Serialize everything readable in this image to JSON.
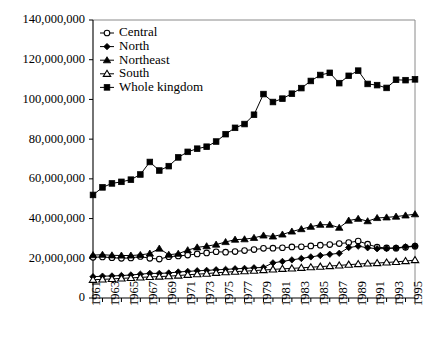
{
  "chart_data": {
    "type": "line",
    "title": "",
    "xlabel": "",
    "ylabel": "",
    "xlim": [
      1961,
      1995
    ],
    "ylim": [
      0,
      140000000
    ],
    "grid": false,
    "legend_position": "top-left inside plot",
    "x": [
      1961,
      1962,
      1963,
      1964,
      1965,
      1966,
      1967,
      1968,
      1969,
      1970,
      1971,
      1972,
      1973,
      1974,
      1975,
      1976,
      1977,
      1978,
      1979,
      1980,
      1981,
      1982,
      1983,
      1984,
      1985,
      1986,
      1987,
      1988,
      1989,
      1990,
      1991,
      1992,
      1993,
      1994,
      1995
    ],
    "xtick_labels": [
      "1961",
      "1963",
      "1965",
      "1967",
      "1969",
      "1971",
      "1973",
      "1975",
      "1977",
      "1979",
      "1981",
      "1983",
      "1985",
      "1987",
      "1989",
      "1991",
      "1993",
      "1995"
    ],
    "ytick_labels": [
      "0",
      "20,000,000",
      "40,000,000",
      "60,000,000",
      "80,000,000",
      "100,000,000",
      "120,000,000",
      "140,000,000"
    ],
    "ytick_values": [
      0,
      20000000,
      40000000,
      60000000,
      80000000,
      100000000,
      120000000,
      140000000
    ],
    "series": [
      {
        "name": "Central",
        "marker": "open-circle",
        "values": [
          20500000,
          20700000,
          20300000,
          20000000,
          20200000,
          20900000,
          20000000,
          19600000,
          20800000,
          21200000,
          21600000,
          22200000,
          22700000,
          23300000,
          23100000,
          23400000,
          23900000,
          24400000,
          25000000,
          25100000,
          25300000,
          25700000,
          25800000,
          26200000,
          26600000,
          26900000,
          27400000,
          27900000,
          28700000,
          27100000,
          25600000,
          25200000,
          25100000,
          25500000,
          26100000
        ]
      },
      {
        "name": "North",
        "marker": "filled-diamond",
        "values": [
          10700000,
          11000000,
          11100000,
          11300000,
          11600000,
          12000000,
          12400000,
          12400000,
          12600000,
          13100000,
          13400000,
          13700000,
          13900000,
          14200000,
          14400000,
          14700000,
          14900000,
          15200000,
          15400000,
          17700000,
          18400000,
          19200000,
          19900000,
          20700000,
          21400000,
          22000000,
          22500000,
          25400000,
          26100000,
          25300000,
          24800000,
          24900000,
          25200000,
          25800000,
          26200000
        ]
      },
      {
        "name": "Northeast",
        "marker": "filled-triangle",
        "values": [
          21600000,
          21800000,
          21500000,
          21400000,
          21400000,
          21700000,
          22400000,
          24900000,
          21800000,
          22300000,
          24100000,
          25500000,
          26100000,
          26900000,
          28200000,
          29400000,
          29600000,
          30300000,
          31500000,
          31000000,
          32000000,
          33500000,
          34700000,
          35900000,
          36900000,
          36900000,
          35400000,
          39000000,
          39900000,
          38700000,
          40300000,
          40600000,
          41000000,
          41600000,
          42200000
        ]
      },
      {
        "name": "South",
        "marker": "open-triangle",
        "values": [
          9200000,
          9400000,
          9600000,
          9900000,
          10100000,
          10400000,
          10600000,
          10800000,
          11000000,
          11300000,
          11700000,
          12000000,
          12300000,
          12700000,
          13000000,
          13300000,
          13500000,
          13800000,
          14100000,
          14400000,
          14700000,
          14900000,
          15200000,
          15500000,
          15800000,
          16100000,
          16400000,
          16800000,
          17100000,
          17400000,
          17600000,
          17900000,
          18200000,
          18600000,
          19100000
        ]
      },
      {
        "name": "Whole kingdom",
        "marker": "filled-square",
        "values": [
          51900000,
          55700000,
          57700000,
          58500000,
          59600000,
          62200000,
          68500000,
          64200000,
          66400000,
          70800000,
          73600000,
          75200000,
          76200000,
          78800000,
          82500000,
          85700000,
          87600000,
          92300000,
          102700000,
          98700000,
          100400000,
          102900000,
          105700000,
          109300000,
          112300000,
          113400000,
          108200000,
          111900000,
          114500000,
          107800000,
          107200000,
          105800000,
          109900000,
          109700000,
          110100000
        ]
      }
    ]
  },
  "legend": {
    "items": [
      {
        "label": "Central"
      },
      {
        "label": "North"
      },
      {
        "label": "Northeast"
      },
      {
        "label": "South"
      },
      {
        "label": "Whole kingdom"
      }
    ]
  },
  "colors": {
    "ink": "#000000",
    "background": "#ffffff",
    "frame": "#8a8a8a"
  }
}
